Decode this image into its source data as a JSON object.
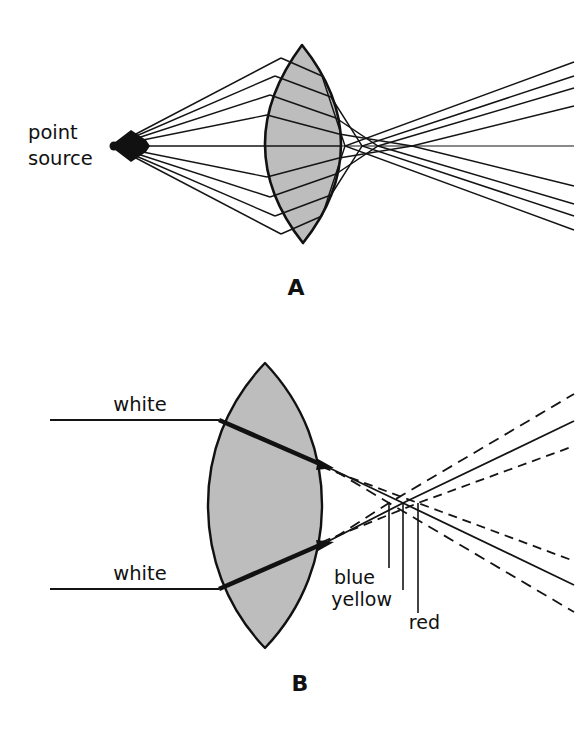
{
  "figure": {
    "title_alt": "Lens aberration diagrams",
    "background_color": "#ffffff",
    "ink_color": "#141414",
    "lens_fill_color": "#bdbdbd",
    "width": 576,
    "height": 741
  },
  "panel_a": {
    "letter": "A",
    "subject": "spherical aberration",
    "source_label_line1": "point",
    "source_label_line2": "source",
    "source_point": {
      "x": 112,
      "y": 146
    },
    "lens": {
      "center_x": 303,
      "center_y": 144,
      "half_height": 100,
      "half_width": 38
    },
    "ray_heights": [
      58,
      74,
      92,
      112,
      144,
      176,
      196,
      214,
      230
    ],
    "axial_crossings": [
      345,
      362,
      378,
      396,
      412,
      430
    ],
    "axis_end_x": 574
  },
  "panel_b": {
    "letter": "B",
    "subject": "chromatic aberration",
    "incoming_label_top": "white",
    "incoming_label_bottom": "white",
    "incoming_ray_top_y": 420,
    "incoming_ray_bottom_y": 589,
    "incoming_ray_start_x": 50,
    "lens": {
      "center_x": 265,
      "center_y": 505,
      "half_height": 143,
      "half_width": 57
    },
    "focus_labels": [
      "blue",
      "yellow",
      "red"
    ],
    "focus_points": [
      {
        "name": "blue",
        "x": 389,
        "y": 503
      },
      {
        "name": "yellow",
        "x": 403,
        "y": 503
      },
      {
        "name": "red",
        "x": 418,
        "y": 503
      }
    ],
    "label_positions": [
      {
        "name": "blue",
        "text_x": 382,
        "text_y": 579
      },
      {
        "name": "yellow",
        "text_x": 382,
        "text_y": 601
      },
      {
        "name": "red",
        "text_x": 404,
        "text_y": 624
      }
    ]
  }
}
